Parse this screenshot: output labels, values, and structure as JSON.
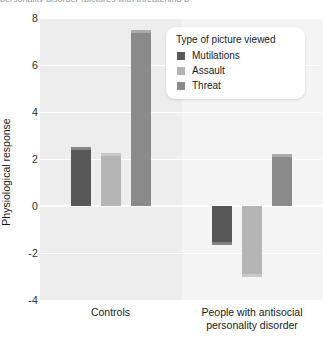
{
  "caption_fragment": "personality disorder (pictures with threatening p",
  "legend": {
    "title": "Type of picture viewed",
    "entries": [
      {
        "label": "Mutilations",
        "color": "#575757"
      },
      {
        "label": "Assault",
        "color": "#b4b4b4"
      },
      {
        "label": "Threat",
        "color": "#8a8a8a"
      }
    ]
  },
  "chart_data": {
    "type": "bar",
    "title": "",
    "xlabel": "",
    "ylabel": "Physiological response",
    "categories": [
      "Controls",
      "People with antisocial personality disorder"
    ],
    "series": [
      {
        "name": "Mutilations",
        "color": "#575757",
        "values": [
          2.5,
          -1.65
        ]
      },
      {
        "name": "Assault",
        "color": "#b4b4b4",
        "values": [
          2.25,
          -3.0
        ]
      },
      {
        "name": "Threat",
        "color": "#8a8a8a",
        "values": [
          7.5,
          2.2
        ]
      }
    ],
    "ylim": [
      -4,
      8
    ],
    "yticks": [
      8,
      6,
      4,
      2,
      0,
      -2,
      -4
    ],
    "ytick_labels": [
      "8",
      "6",
      "4",
      "2",
      "0",
      "-2",
      "-4"
    ],
    "grid": true,
    "legend_position": "upper right",
    "zero_line": true
  }
}
